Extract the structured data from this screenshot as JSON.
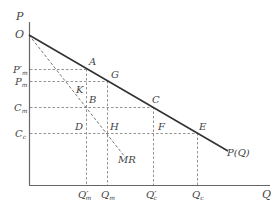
{
  "diagram": {
    "axes": {
      "y_label": "P",
      "x_label": "Q",
      "origin_label": "O"
    },
    "curves": {
      "demand_label": "P(Q)",
      "mr_label": "MR"
    },
    "y_ticks": [
      {
        "main": "P",
        "sub": "m",
        "prime": "′",
        "y": 69
      },
      {
        "main": "P",
        "sub": "m",
        "prime": "",
        "y": 81
      },
      {
        "main": "C",
        "sub": "m",
        "prime": "",
        "y": 107
      },
      {
        "main": "C",
        "sub": "c",
        "prime": "",
        "y": 133
      }
    ],
    "x_ticks": [
      {
        "main": "Q",
        "sub": "m",
        "prime": "′",
        "x": 86
      },
      {
        "main": "Q",
        "sub": "m",
        "prime": "",
        "x": 107
      },
      {
        "main": "Q",
        "sub": "c",
        "prime": "′",
        "x": 153
      },
      {
        "main": "Q",
        "sub": "c",
        "prime": "",
        "x": 197
      }
    ],
    "points": {
      "A": "A",
      "G": "G",
      "K": "K",
      "B": "B",
      "C": "C",
      "D": "D",
      "H": "H",
      "F": "F",
      "E": "E"
    }
  }
}
